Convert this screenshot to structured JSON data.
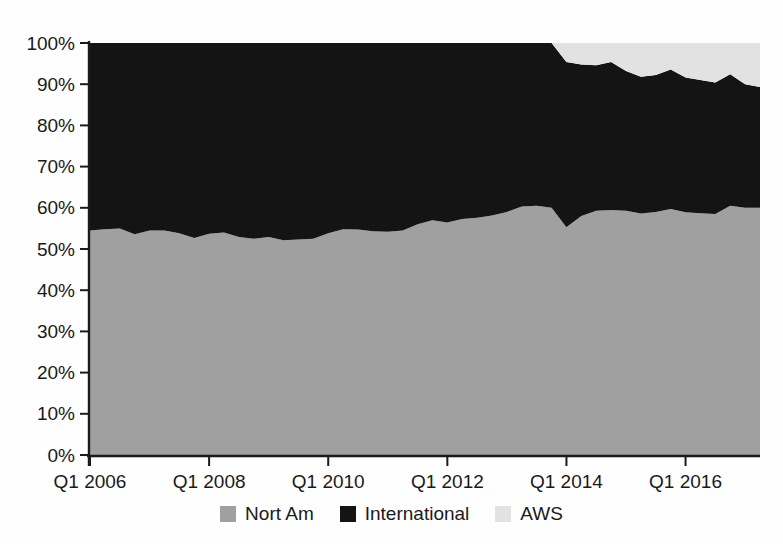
{
  "chart_data": {
    "type": "area",
    "stacked_percent": true,
    "title": "",
    "xlabel": "",
    "ylabel": "",
    "ylim": [
      0,
      100
    ],
    "grid": false,
    "legend_position": "bottom",
    "axis_color": "#1a1a1a",
    "background_color": "#fefefe",
    "y_tick_values": [
      0,
      10,
      20,
      30,
      40,
      50,
      60,
      70,
      80,
      90,
      100
    ],
    "y_tick_labels": [
      "0%",
      "10%",
      "20%",
      "30%",
      "40%",
      "50%",
      "60%",
      "70%",
      "80%",
      "90%",
      "100%"
    ],
    "x_tick_indices": [
      0,
      8,
      16,
      24,
      32,
      40
    ],
    "x_tick_labels": [
      "Q1 2006",
      "Q1 2008",
      "Q1 2010",
      "Q1 2012",
      "Q1 2014",
      "Q1 2016"
    ],
    "categories": [
      "Q1 2006",
      "Q2 2006",
      "Q3 2006",
      "Q4 2006",
      "Q1 2007",
      "Q2 2007",
      "Q3 2007",
      "Q4 2007",
      "Q1 2008",
      "Q2 2008",
      "Q3 2008",
      "Q4 2008",
      "Q1 2009",
      "Q2 2009",
      "Q3 2009",
      "Q4 2009",
      "Q1 2010",
      "Q2 2010",
      "Q3 2010",
      "Q4 2010",
      "Q1 2011",
      "Q2 2011",
      "Q3 2011",
      "Q4 2011",
      "Q1 2012",
      "Q2 2012",
      "Q3 2012",
      "Q4 2012",
      "Q1 2013",
      "Q2 2013",
      "Q3 2013",
      "Q4 2013",
      "Q1 2014",
      "Q2 2014",
      "Q3 2014",
      "Q4 2014",
      "Q1 2015",
      "Q2 2015",
      "Q3 2015",
      "Q4 2015",
      "Q1 2016",
      "Q2 2016",
      "Q3 2016",
      "Q4 2016",
      "Q1 2017",
      "Q2 2017"
    ],
    "series": [
      {
        "name": "Nort Am",
        "color": "#a0a0a0",
        "values": [
          54.5,
          54.8,
          55.0,
          53.6,
          54.5,
          54.5,
          53.8,
          52.7,
          53.7,
          54.0,
          52.9,
          52.5,
          52.9,
          52.1,
          52.3,
          52.5,
          53.8,
          54.8,
          54.7,
          54.3,
          54.2,
          54.5,
          56.0,
          57.0,
          56.4,
          57.3,
          57.6,
          58.1,
          59.0,
          60.3,
          60.5,
          60.0,
          55.3,
          58.0,
          59.3,
          59.5,
          59.3,
          58.6,
          59.0,
          59.7,
          58.9,
          58.7,
          58.5,
          60.5,
          60.0,
          60.0
        ]
      },
      {
        "name": "International",
        "color": "#141414",
        "values": [
          45.5,
          45.2,
          45.0,
          46.4,
          45.5,
          45.5,
          46.2,
          47.3,
          46.3,
          46.0,
          47.1,
          47.5,
          47.1,
          47.9,
          47.7,
          47.5,
          46.2,
          45.2,
          45.3,
          45.7,
          45.8,
          45.5,
          44.0,
          43.0,
          43.6,
          42.7,
          42.4,
          41.9,
          41.0,
          39.7,
          39.5,
          40.0,
          40.1,
          36.8,
          35.3,
          35.9,
          33.9,
          33.2,
          33.2,
          33.9,
          32.7,
          32.3,
          31.9,
          31.9,
          30.0,
          29.3
        ]
      },
      {
        "name": "AWS",
        "color": "#e2e2e2",
        "values": [
          0,
          0,
          0,
          0,
          0,
          0,
          0,
          0,
          0,
          0,
          0,
          0,
          0,
          0,
          0,
          0,
          0,
          0,
          0,
          0,
          0,
          0,
          0,
          0,
          0,
          0,
          0,
          0,
          0,
          0,
          0,
          0,
          4.6,
          5.2,
          5.4,
          4.6,
          6.8,
          8.2,
          7.8,
          6.4,
          8.4,
          9.0,
          9.6,
          7.6,
          10.0,
          10.7
        ]
      }
    ]
  }
}
